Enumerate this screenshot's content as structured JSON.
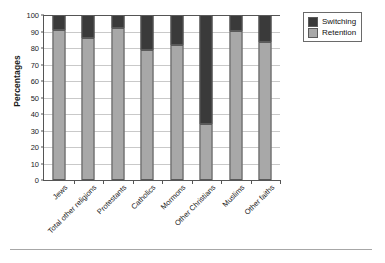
{
  "chart_data": {
    "type": "bar",
    "subtype": "stacked-vertical-100",
    "title": "",
    "xlabel": "",
    "ylabel": "Percentages",
    "ylim": [
      0,
      100
    ],
    "ytick_step": 10,
    "yticks": [
      0,
      10,
      20,
      30,
      40,
      50,
      60,
      70,
      80,
      90,
      100
    ],
    "ytick_labels": [
      "0",
      "10",
      "20",
      "30",
      "40",
      "50",
      "60",
      "70",
      "80",
      "90",
      "100"
    ],
    "grid": true,
    "grid_axis": "y",
    "legend_position": "upper-right-outside",
    "categories": [
      "Jews",
      "Total other religions",
      "Protestants",
      "Catholics",
      "Mormons",
      "Other Christians",
      "Muslims",
      "Other faiths"
    ],
    "series": [
      {
        "name": "Retention",
        "color": "#a8a8a8",
        "values": [
          91,
          86,
          92,
          79,
          82,
          34,
          90.5,
          83.5
        ]
      },
      {
        "name": "Switching",
        "color": "#3a3a3a",
        "values": [
          9,
          14,
          8,
          21,
          18,
          66,
          9.5,
          16.5
        ]
      }
    ]
  },
  "legend": {
    "items": [
      {
        "label": "Switching",
        "swatch": "#3a3a3a"
      },
      {
        "label": "Retention",
        "swatch": "#a8a8a8"
      }
    ]
  },
  "colors": {
    "retention": "#a8a8a8",
    "switching": "#3a3a3a",
    "axis": "#555555",
    "grid": "#c9c9c9",
    "text": "#1b1b1b",
    "background": "#ffffff"
  }
}
